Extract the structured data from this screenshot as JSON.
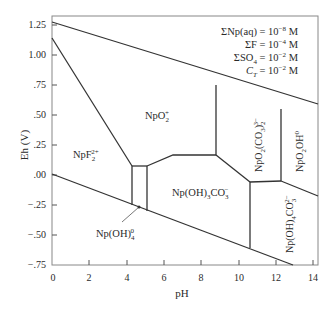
{
  "diagram": {
    "type": "Eh-pH (Pourbaix) diagram",
    "x_axis": {
      "label": "pH",
      "ticks": [
        "0",
        "2",
        "4",
        "6",
        "8",
        "10",
        "12",
        "14"
      ],
      "range": [
        0,
        14.2
      ]
    },
    "y_axis": {
      "label": "Eh (V)",
      "ticks": [
        "1.25",
        "1.00",
        ".75",
        ".50",
        ".25",
        ".00",
        "−.25",
        "−.50",
        "−.75"
      ],
      "range": [
        -0.75,
        1.3
      ]
    },
    "conditions": [
      {
        "lhs": "ΣNp(aq)",
        "rhs": "10",
        "exp": "−8",
        "unit": "M"
      },
      {
        "lhs": "ΣF",
        "rhs": "10",
        "exp": "−4",
        "unit": "M"
      },
      {
        "lhs": "ΣSO",
        "sub": "4",
        "rhs": "10",
        "exp": "−2",
        "unit": "M"
      },
      {
        "lhs": "C",
        "sub": "T",
        "rhs": "10",
        "exp": "−2",
        "unit": "M"
      }
    ],
    "fields": {
      "npo2": {
        "base": "NpO",
        "sub": "2",
        "sup": "+"
      },
      "npf2": {
        "base": "NpF",
        "sub": "2",
        "sup": "2+"
      },
      "npoh3co3": {
        "base": "Np(OH)",
        "sub": "3",
        "mid": "CO",
        "sub2": "3",
        "sup": "−"
      },
      "npoh4": {
        "base": "Np(OH)",
        "sub": "4",
        "sup": "0"
      },
      "npo2co3": {
        "base": "NpO",
        "sub": "2",
        "mid": "(CO",
        "sub2": "3",
        "tail": ")",
        "sub3": "2",
        "sup": "3−"
      },
      "npo2oh": {
        "base": "NpO",
        "sub": "2",
        "mid": "OH",
        "sup": "0"
      },
      "npoh4co3": {
        "base": "Np(OH)",
        "sub": "4",
        "mid": "CO",
        "sub2": "3",
        "sup": "2−"
      }
    }
  }
}
